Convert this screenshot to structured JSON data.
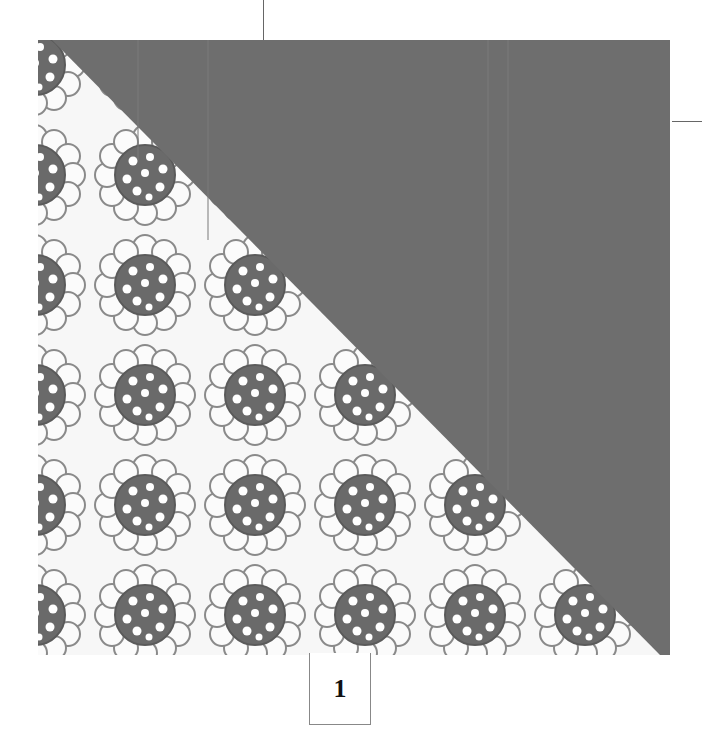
{
  "diagram": {
    "type": "quilt-block",
    "block_label": "1",
    "colors": {
      "solid_fabric": "#6e6e6e",
      "print_background": "#f7f7f7",
      "flower_center": "#6a6a6a",
      "petal_outline": "#8a8a8a",
      "guide_lines": "#666666"
    },
    "pieces": [
      {
        "name": "print-triangle",
        "position": "lower-left",
        "pattern": "sunflower-print"
      },
      {
        "name": "solid-triangle",
        "position": "upper-right",
        "pattern": "solid-gray"
      }
    ]
  }
}
